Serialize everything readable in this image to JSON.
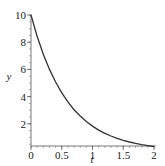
{
  "chart_data": {
    "type": "line",
    "title": "",
    "xlabel": "t",
    "ylabel": "y",
    "xlim": [
      0,
      2
    ],
    "ylim": [
      0.33,
      10
    ],
    "grid": false,
    "legend": null,
    "x_ticks": [
      "0",
      "0.5",
      "1",
      "1.5",
      "2"
    ],
    "y_ticks": [
      "2",
      "4",
      "6",
      "8",
      "10"
    ],
    "series": [
      {
        "name": "y(t)",
        "color": "#333333",
        "x": [
          0,
          0.1,
          0.2,
          0.3,
          0.4,
          0.5,
          0.6,
          0.7,
          0.8,
          0.9,
          1.0,
          1.1,
          1.2,
          1.3,
          1.4,
          1.5,
          1.6,
          1.7,
          1.8,
          1.9,
          2.0
        ],
        "y": [
          10,
          8.44,
          7.12,
          6.0,
          5.07,
          4.27,
          3.61,
          3.04,
          2.57,
          2.17,
          1.83,
          1.54,
          1.3,
          1.1,
          0.93,
          0.78,
          0.66,
          0.56,
          0.47,
          0.4,
          0.33
        ]
      }
    ]
  }
}
